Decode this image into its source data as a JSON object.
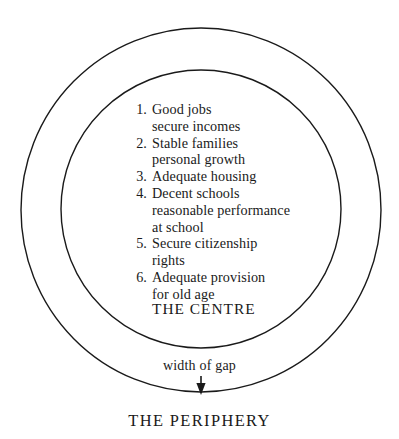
{
  "diagram": {
    "type": "concentric-circles",
    "background_color": "#ffffff",
    "stroke_color": "#1a1a1a",
    "outer_circle": {
      "cx": 201,
      "cy": 210,
      "rx": 180,
      "ry": 182,
      "stroke_width": 1.4
    },
    "inner_circle": {
      "cx": 201,
      "cy": 209,
      "rx": 140,
      "ry": 139,
      "stroke_width": 1.4
    },
    "arrow": {
      "x": 201,
      "y_start": 376,
      "y_end": 393,
      "direction": "down",
      "stroke_width": 1.3
    }
  },
  "centre": {
    "items": [
      {
        "num": "1.",
        "line1": "Good jobs",
        "line2": "secure incomes"
      },
      {
        "num": "2.",
        "line1": "Stable families",
        "line2": "personal growth"
      },
      {
        "num": "3.",
        "line1": "Adequate housing",
        "line2": ""
      },
      {
        "num": "4.",
        "line1": "Decent schools",
        "line2": "reasonable performance",
        "line3": "at school"
      },
      {
        "num": "5.",
        "line1": "Secure citizenship",
        "line2": "rights"
      },
      {
        "num": "6.",
        "line1": "Adequate provision",
        "line2": "for old age"
      }
    ],
    "label": "THE CENTRE"
  },
  "annotations": {
    "gap_label": "width of gap",
    "periphery_label": "THE PERIPHERY"
  }
}
